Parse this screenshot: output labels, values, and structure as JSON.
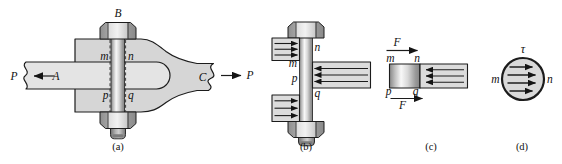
{
  "colors": {
    "outline": "#1c1c1c",
    "member": "#d6d6d6",
    "bar": "#e4e4e4",
    "block": "#dcdcdc",
    "circle": "#d9d9d9",
    "text": "#111111"
  },
  "panel_a": {
    "caption": "(a)",
    "bolt_label": "B",
    "bar_label": "A",
    "member_label": "C",
    "load_left": "P",
    "load_right": "P",
    "m": "m",
    "n": "n",
    "p": "p",
    "q": "q"
  },
  "panel_b": {
    "caption": "(b)",
    "m": "m",
    "n": "n",
    "p": "p",
    "q": "q"
  },
  "panel_c": {
    "caption": "(c)",
    "force_top": "F",
    "force_bottom": "F",
    "m": "m",
    "n": "n",
    "p": "p",
    "q": "q"
  },
  "panel_d": {
    "caption": "(d)",
    "stress_label": "τ",
    "m": "m",
    "n": "n"
  }
}
